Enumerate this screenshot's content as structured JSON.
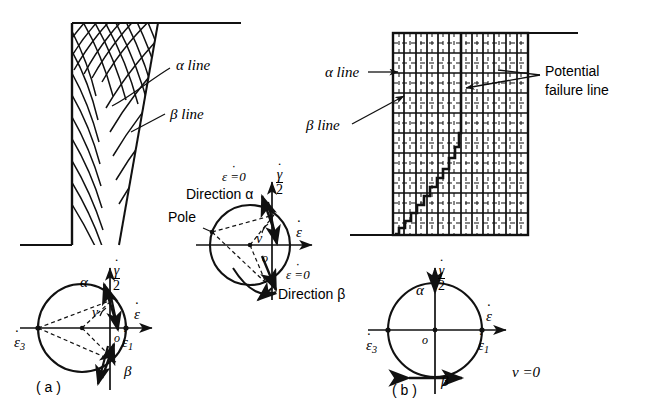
{
  "figure": {
    "domain": "engineering-diagram",
    "ink_color": "#111111",
    "paper_color": "#ffffff"
  },
  "panel_a": {
    "caption": "( a )",
    "labels": {
      "alpha_line": "α  line",
      "beta_line": "β line"
    },
    "wedge": {
      "type": "crosshatched-wedge",
      "top_y": 23,
      "bottom_y": 245,
      "left_x": 72,
      "top_right_x": 158,
      "hatch_families": 2,
      "hatch_note": "curved alpha and beta slip lines crossing at an angle"
    },
    "ground_line": {
      "from_x": 158,
      "to_x": 240,
      "y": 23
    },
    "base_line": {
      "from_x": 20,
      "to_x": 72,
      "y": 245
    },
    "mohr_circle": {
      "name": "mohr-circle-a",
      "cx": 82,
      "cy": 328,
      "r": 44,
      "center_offset_note": "circle center left of origin o; circle passes through origin region",
      "origin_label": "o",
      "axis_horizontal": "ε",
      "axis_horizontal_dot": true,
      "axis_vertical_numerator": "γ",
      "axis_vertical_denominator": "2",
      "point_left": "ε",
      "point_left_sub": "3",
      "point_right": "ε",
      "point_right_sub": "1",
      "angle_label": "ν",
      "alpha_label": "α",
      "beta_label": "β",
      "dashed_chords": 3,
      "has_pole_construction": true
    }
  },
  "panel_center": {
    "name": "mohr-circle-enlarged",
    "cx": 250,
    "cy": 245,
    "r": 40,
    "labels": {
      "pole": "Pole",
      "epsdot_zero_top": "ε =0",
      "direction_alpha": "Direction α",
      "epsdot_zero_bottom": "ε =0",
      "direction_beta": "Direction β",
      "origin": "o",
      "nu": "ν",
      "axis_horizontal": "ε",
      "axis_vertical_numerator": "γ",
      "axis_vertical_denominator": "2"
    }
  },
  "panel_b": {
    "caption": "( b )",
    "labels": {
      "alpha_line": "α  line",
      "beta_line": "β line",
      "potential_failure_line_1": "Potential",
      "potential_failure_line_2": "failure  line",
      "nu_equals_zero": "ν =0"
    },
    "grid": {
      "type": "orthogonal-grid",
      "left_x": 393,
      "top_y": 33,
      "right_x": 528,
      "bottom_y": 235,
      "columns": 12,
      "rows": 10,
      "line_style": "solid major with dashed interior ticks",
      "note": "alpha lines horizontal, beta lines vertical (nu = 0)"
    },
    "ground_line": {
      "from_x": 528,
      "to_x": 578,
      "y": 33
    },
    "base_line": {
      "from_x": 350,
      "to_x": 393,
      "y": 235
    },
    "failure_line": {
      "type": "stepped-polyline",
      "note": "staircase path rising from bottom-left corner to the top of the grid",
      "points": [
        [
          396,
          233
        ],
        [
          400,
          228
        ],
        [
          404,
          228
        ],
        [
          406,
          221
        ],
        [
          410,
          221
        ],
        [
          412,
          213
        ],
        [
          417,
          213
        ],
        [
          419,
          205
        ],
        [
          424,
          205
        ],
        [
          426,
          196
        ],
        [
          430,
          196
        ],
        [
          433,
          187
        ],
        [
          437,
          187
        ],
        [
          439,
          178
        ],
        [
          443,
          178
        ],
        [
          445,
          169
        ],
        [
          449,
          169
        ],
        [
          451,
          158
        ],
        [
          454,
          158
        ],
        [
          456,
          147
        ],
        [
          458,
          147
        ],
        [
          459,
          135
        ],
        [
          460,
          135
        ],
        [
          461,
          120
        ],
        [
          461,
          105
        ],
        [
          461,
          90
        ],
        [
          461,
          70
        ],
        [
          461,
          50
        ],
        [
          461,
          36
        ]
      ]
    },
    "mohr_circle": {
      "name": "mohr-circle-b",
      "cx": 435,
      "cy": 330,
      "r": 47,
      "origin_label": "o",
      "axis_horizontal": "ε",
      "axis_vertical_numerator": "γ",
      "axis_vertical_denominator": "2",
      "point_left": "ε",
      "point_left_sub": "3",
      "point_right": "ε",
      "point_right_sub": "1",
      "alpha_label": "α",
      "beta_label": "β",
      "nu": "ν =0",
      "note": "centered on origin; alpha at top of circle, beta at bottom"
    }
  }
}
